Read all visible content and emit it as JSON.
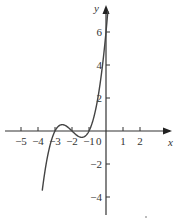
{
  "chart_data": {
    "type": "line",
    "title": "",
    "xlabel": "x",
    "ylabel": "y",
    "xlim": [
      -5.5,
      3.2
    ],
    "ylim": [
      -5,
      7.2
    ],
    "grid": false,
    "x_ticks": [
      -5,
      -4,
      -3,
      -2,
      -1,
      1,
      2
    ],
    "x_tick_labels": [
      "−5",
      "−4",
      "−3",
      "−2",
      "−1",
      "1",
      "2"
    ],
    "y_ticks": [
      6,
      4,
      2,
      -2,
      -4
    ],
    "y_tick_labels": [
      "6",
      "4",
      "2",
      "−2",
      "−4"
    ],
    "origin_label": "0",
    "series": [
      {
        "name": "cubic curve",
        "equation": "y = (x+1)(x+2)(x+3)",
        "x": [
          -3.75,
          -3.5,
          -3.25,
          -3.0,
          -2.75,
          -2.5,
          -2.25,
          -2.0,
          -1.75,
          -1.5,
          -1.25,
          -1.0,
          -0.75,
          -0.5,
          -0.25,
          0.0,
          0.1
        ],
        "y": [
          -3.05,
          -1.88,
          -0.98,
          0.0,
          0.23,
          0.38,
          0.27,
          0.0,
          -0.23,
          -0.38,
          -0.23,
          0.0,
          0.66,
          1.88,
          3.61,
          6.0,
          7.1
        ]
      }
    ],
    "annotations": [
      "x-axis roots at -3, -2, -1",
      "y-intercept at 6"
    ]
  },
  "axes": {
    "x_label": "x",
    "y_label": "y",
    "origin": "0"
  },
  "colors": {
    "axis": "#333333",
    "curve": "#444444",
    "background": "#ffffff"
  }
}
